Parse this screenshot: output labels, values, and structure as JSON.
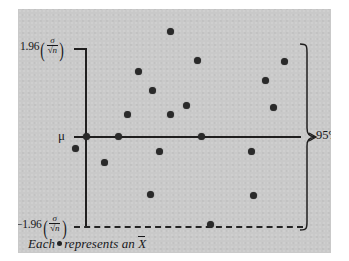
{
  "figure": {
    "background_color": "#ffffff",
    "panel_color": "#c9c9c9",
    "ink_color": "#201f1f"
  },
  "labels": {
    "upper_bound_coefficient": "1.96",
    "lower_bound_coefficient": "−1.96",
    "sigma_symbol": "σ",
    "sqrt_n": "√n",
    "mu_symbol": "μ",
    "confidence_level": "95%",
    "caption_prefix": "Each",
    "caption_suffix": "represents an",
    "caption_statistic": "X"
  },
  "chart_data": {
    "type": "scatter",
    "title": "",
    "xlabel": "",
    "ylabel": "",
    "xlim": [
      0,
      1
    ],
    "ylim": [
      -1.35,
      1.35
    ],
    "grid": false,
    "legend": "none",
    "annotations": [
      {
        "name": "upper-bound",
        "text": "1.96(σ/√n)",
        "value": 1.0,
        "style": "solid-tick"
      },
      {
        "name": "center-line",
        "text": "μ",
        "value": 0.0,
        "style": "solid-axis"
      },
      {
        "name": "lower-bound",
        "text": "−1.96(σ/√n)",
        "value": -1.0,
        "style": "dashed"
      },
      {
        "name": "confidence-brace",
        "text": "95%",
        "value": 0.0,
        "style": "brace"
      }
    ],
    "series": [
      {
        "name": "sample means",
        "marker": "filled-circle",
        "color": "#2a2a2a",
        "points": [
          {
            "x": 0.425,
            "y": 1.19
          },
          {
            "x": 0.055,
            "y": 0.0
          },
          {
            "x": 0.545,
            "y": 0.86
          },
          {
            "x": 0.925,
            "y": 0.85
          },
          {
            "x": 0.285,
            "y": 0.73
          },
          {
            "x": 0.845,
            "y": 0.63
          },
          {
            "x": 0.345,
            "y": 0.52
          },
          {
            "x": 0.495,
            "y": 0.35
          },
          {
            "x": 0.88,
            "y": 0.32
          },
          {
            "x": 0.235,
            "y": 0.25
          },
          {
            "x": 0.425,
            "y": 0.24
          },
          {
            "x": 0.195,
            "y": 0.0
          },
          {
            "x": 0.56,
            "y": 0.0
          },
          {
            "x": 0.005,
            "y": -0.14
          },
          {
            "x": 0.375,
            "y": -0.17
          },
          {
            "x": 0.78,
            "y": -0.17
          },
          {
            "x": 0.135,
            "y": -0.3
          },
          {
            "x": 0.335,
            "y": -0.66
          },
          {
            "x": 0.79,
            "y": -0.68
          },
          {
            "x": 0.6,
            "y": -1.0
          }
        ]
      }
    ],
    "notes": {
      "outside_interval_count": 1,
      "on_lower_boundary_count": 1,
      "total_points": 20
    }
  }
}
